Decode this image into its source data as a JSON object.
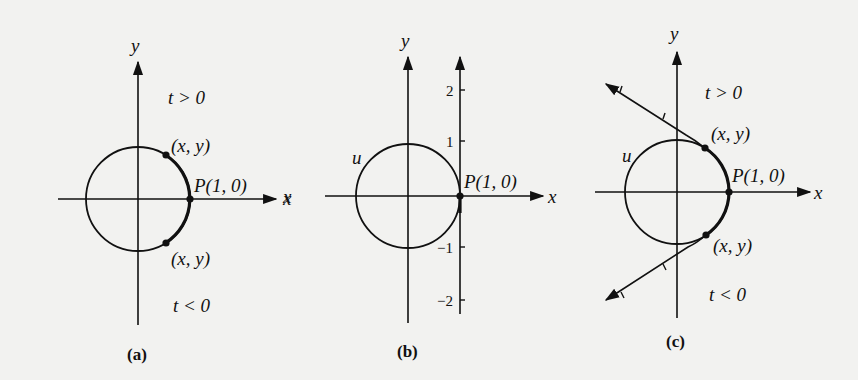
{
  "figure": {
    "background_color": "#f2f2f0",
    "ink_color": "#111111",
    "panels": [
      {
        "id": "a",
        "caption": "(a)",
        "axis_labels": {
          "x": "x",
          "y": "y"
        },
        "point_label": "P(1, 0)",
        "upper_point_label": "(x, y)",
        "lower_point_label": "(x, y)",
        "region_upper": "t > 0",
        "region_lower": "t < 0"
      },
      {
        "id": "b",
        "caption": "(b)",
        "axis_labels": {
          "x_right": "x",
          "x_left": "x",
          "y": "y"
        },
        "circle_label": "u",
        "point_label": "P(1, 0)",
        "number_line_ticks": [
          "2",
          "1",
          "−1",
          "−2"
        ]
      },
      {
        "id": "c",
        "caption": "(c)",
        "axis_labels": {
          "x": "x",
          "y": "y"
        },
        "circle_label": "u",
        "point_label": "P(1, 0)",
        "upper_point_label": "(x, y)",
        "lower_point_label": "(x, y)",
        "region_upper": "t > 0",
        "region_lower": "t < 0"
      }
    ]
  }
}
